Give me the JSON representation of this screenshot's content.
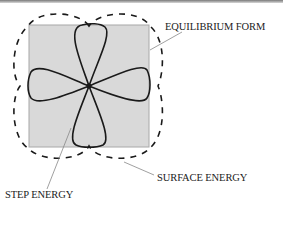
{
  "labels": {
    "equilibrium_form": "EQUILIBRIUM FORM",
    "surface_energy": "SURFACE ENERGY",
    "step_energy": "STEP ENERGY"
  },
  "colors": {
    "square_fill": "#d9d9d9",
    "square_stroke": "#a8a8a8",
    "curve_stroke": "#1a1a1a",
    "leader_line": "#888888"
  }
}
